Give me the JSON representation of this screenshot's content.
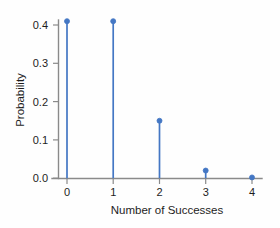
{
  "chart_data": {
    "type": "scatter",
    "plot_style": "stem",
    "title": "",
    "xlabel": "Number of Successes",
    "ylabel": "Probability",
    "categories": [
      "0",
      "1",
      "2",
      "3",
      "4"
    ],
    "x": [
      0,
      1,
      2,
      3,
      4
    ],
    "values": [
      0.41,
      0.41,
      0.15,
      0.02,
      0.002
    ],
    "xlim": [
      -0.25,
      4.35
    ],
    "ylim": [
      0.0,
      0.43
    ],
    "xticks": [
      0,
      1,
      2,
      3,
      4
    ],
    "xtick_labels": [
      "0",
      "1",
      "2",
      "3",
      "4"
    ],
    "yticks": [
      0.0,
      0.1,
      0.2,
      0.3,
      0.4
    ],
    "ytick_labels": [
      "0.0",
      "0.1",
      "0.2",
      "0.3",
      "0.4"
    ],
    "grid": false,
    "legend": false,
    "series_color": "#4477c4",
    "marker": "circle",
    "axis_color": "#8a8a8a",
    "background": "#fefefe"
  },
  "axes": {
    "y_label": "Probability",
    "x_label": "Number of Successes"
  },
  "yticks": {
    "t0": "0.0",
    "t1": "0.1",
    "t2": "0.2",
    "t3": "0.3",
    "t4": "0.4"
  },
  "xticks": {
    "t0": "0",
    "t1": "1",
    "t2": "2",
    "t3": "3",
    "t4": "4"
  }
}
